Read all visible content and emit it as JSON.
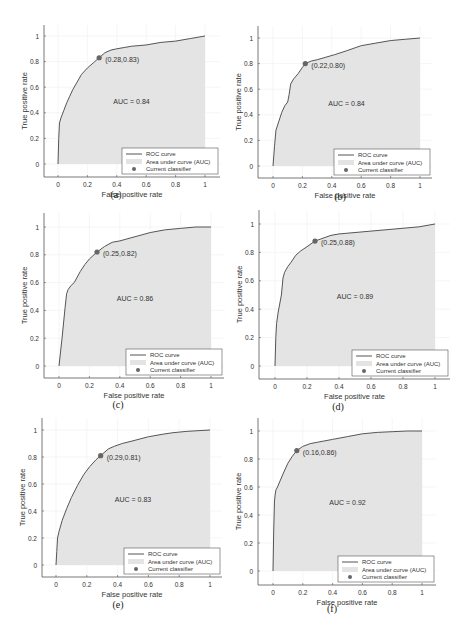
{
  "style": {
    "curve_color": "#555555",
    "fill_color": "#e4e4e4",
    "marker_color": "#666666",
    "axis_color": "#555555",
    "grid_color": "#eeeeee",
    "text_color": "#333333"
  },
  "chart_data": [
    {
      "id": "a",
      "caption": "(a)",
      "type": "area",
      "title": "",
      "xlabel": "False positive rate",
      "ylabel": "True positive rate",
      "xlim": [
        -0.1,
        1.1
      ],
      "ylim": [
        -0.1,
        1.1
      ],
      "xticks": [
        "0",
        "0.2",
        "0.4",
        "0.6",
        "0.8",
        "1"
      ],
      "yticks": [
        "0",
        "0.2",
        "0.4",
        "0.6",
        "0.8",
        "1"
      ],
      "grid": true,
      "legend": [
        "ROC curve",
        "Area under curve (AUC)",
        "Current classifier"
      ],
      "legend_position": "lower right",
      "auc_label": "AUC = 0.84",
      "classifier_point": {
        "x": 0.28,
        "y": 0.83,
        "label": "(0.28,0.83)"
      },
      "x": [
        0,
        0.005,
        0.01,
        0.02,
        0.04,
        0.06,
        0.08,
        0.1,
        0.13,
        0.16,
        0.2,
        0.24,
        0.28,
        0.32,
        0.36,
        0.4,
        0.45,
        0.5,
        0.6,
        0.7,
        0.8,
        0.9,
        1.0
      ],
      "y": [
        0,
        0.2,
        0.32,
        0.36,
        0.42,
        0.48,
        0.53,
        0.58,
        0.64,
        0.7,
        0.75,
        0.79,
        0.83,
        0.87,
        0.89,
        0.9,
        0.91,
        0.92,
        0.93,
        0.95,
        0.96,
        0.98,
        1.0
      ]
    },
    {
      "id": "b",
      "caption": "(b)",
      "type": "area",
      "title": "",
      "xlabel": "False positive rate",
      "ylabel": "True positive rate",
      "xlim": [
        -0.1,
        1.1
      ],
      "ylim": [
        -0.1,
        1.1
      ],
      "xticks": [
        "0",
        "0.2",
        "0.4",
        "0.6",
        "0.8",
        "1"
      ],
      "yticks": [
        "0",
        "0.2",
        "0.4",
        "0.6",
        "0.8",
        "1"
      ],
      "grid": true,
      "legend": [
        "ROC curve",
        "Area under curve (AUC)",
        "Current classifier"
      ],
      "legend_position": "lower right",
      "auc_label": "AUC = 0.84",
      "classifier_point": {
        "x": 0.22,
        "y": 0.8,
        "label": "(0.22,0.80)"
      },
      "x": [
        0,
        0.01,
        0.02,
        0.04,
        0.06,
        0.08,
        0.1,
        0.11,
        0.12,
        0.14,
        0.17,
        0.2,
        0.22,
        0.26,
        0.3,
        0.36,
        0.42,
        0.5,
        0.6,
        0.7,
        0.8,
        0.9,
        1.0
      ],
      "y": [
        0,
        0.15,
        0.28,
        0.35,
        0.42,
        0.47,
        0.5,
        0.56,
        0.64,
        0.68,
        0.72,
        0.77,
        0.8,
        0.82,
        0.83,
        0.85,
        0.87,
        0.9,
        0.94,
        0.96,
        0.98,
        0.99,
        1.0
      ]
    },
    {
      "id": "c",
      "caption": "(c)",
      "type": "area",
      "title": "",
      "xlabel": "False positive rate",
      "ylabel": "True positive rate",
      "xlim": [
        -0.1,
        1.1
      ],
      "ylim": [
        -0.1,
        1.1
      ],
      "xticks": [
        "0",
        "0.2",
        "0.4",
        "0.6",
        "0.8",
        "1"
      ],
      "yticks": [
        "0",
        "0.2",
        "0.4",
        "0.6",
        "0.8",
        "1"
      ],
      "grid": true,
      "legend": [
        "ROC curve",
        "Area under curve (AUC)",
        "Current classifier"
      ],
      "legend_position": "lower right",
      "auc_label": "AUC = 0.86",
      "classifier_point": {
        "x": 0.25,
        "y": 0.82,
        "label": "(0.25,0.82)"
      },
      "x": [
        0,
        0.02,
        0.04,
        0.05,
        0.06,
        0.08,
        0.1,
        0.12,
        0.14,
        0.17,
        0.2,
        0.25,
        0.3,
        0.35,
        0.4,
        0.5,
        0.6,
        0.7,
        0.8,
        0.9,
        1.0
      ],
      "y": [
        0,
        0.2,
        0.42,
        0.52,
        0.55,
        0.58,
        0.6,
        0.64,
        0.68,
        0.73,
        0.77,
        0.82,
        0.86,
        0.89,
        0.9,
        0.93,
        0.96,
        0.98,
        0.99,
        1.0,
        1.0
      ]
    },
    {
      "id": "d",
      "caption": "(d)",
      "type": "area",
      "title": "",
      "xlabel": "False positive rate",
      "ylabel": "True positive rate",
      "xlim": [
        -0.1,
        1.1
      ],
      "ylim": [
        -0.1,
        1.1
      ],
      "xticks": [
        "0",
        "0.2",
        "0.4",
        "0.6",
        "0.8",
        "1"
      ],
      "yticks": [
        "0",
        "0.2",
        "0.4",
        "0.6",
        "0.8",
        "1"
      ],
      "grid": true,
      "legend": [
        "ROC curve",
        "Area under curve (AUC)",
        "Current classifier"
      ],
      "legend_position": "lower right",
      "auc_label": "AUC = 0.89",
      "classifier_point": {
        "x": 0.25,
        "y": 0.88,
        "label": "(0.25,0.88)"
      },
      "x": [
        0,
        0.005,
        0.01,
        0.02,
        0.04,
        0.05,
        0.06,
        0.08,
        0.1,
        0.13,
        0.16,
        0.2,
        0.25,
        0.3,
        0.35,
        0.4,
        0.5,
        0.6,
        0.7,
        0.8,
        0.9,
        1.0
      ],
      "y": [
        0,
        0.2,
        0.3,
        0.38,
        0.5,
        0.62,
        0.66,
        0.7,
        0.73,
        0.78,
        0.81,
        0.84,
        0.88,
        0.9,
        0.92,
        0.93,
        0.94,
        0.95,
        0.96,
        0.97,
        0.98,
        1.0
      ]
    },
    {
      "id": "e",
      "caption": "(e)",
      "type": "area",
      "title": "",
      "xlabel": "False positive rate",
      "ylabel": "True positive rate",
      "xlim": [
        -0.1,
        1.1
      ],
      "ylim": [
        -0.1,
        1.1
      ],
      "xticks": [
        "0",
        "0.2",
        "0.4",
        "0.6",
        "0.8",
        "1"
      ],
      "yticks": [
        "0",
        "0.2",
        "0.4",
        "0.6",
        "0.8",
        "1"
      ],
      "grid": true,
      "legend": [
        "ROC curve",
        "Area under curve (AUC)",
        "Current classifier"
      ],
      "legend_position": "lower right",
      "auc_label": "AUC = 0.83",
      "classifier_point": {
        "x": 0.29,
        "y": 0.81,
        "label": "(0.29,0.81)"
      },
      "x": [
        0,
        0.005,
        0.01,
        0.02,
        0.04,
        0.07,
        0.1,
        0.14,
        0.18,
        0.22,
        0.26,
        0.29,
        0.34,
        0.38,
        0.43,
        0.5,
        0.6,
        0.7,
        0.76,
        0.85,
        1.0
      ],
      "y": [
        0,
        0.1,
        0.2,
        0.25,
        0.33,
        0.42,
        0.5,
        0.59,
        0.67,
        0.73,
        0.78,
        0.81,
        0.86,
        0.88,
        0.9,
        0.92,
        0.95,
        0.97,
        0.98,
        0.99,
        1.0
      ]
    },
    {
      "id": "f",
      "caption": "(f)",
      "type": "area",
      "title": "",
      "xlabel": "False positive rate",
      "ylabel": "True positive rate",
      "xlim": [
        -0.1,
        1.1
      ],
      "ylim": [
        -0.1,
        1.1
      ],
      "xticks": [
        "0",
        "0.2",
        "0.4",
        "0.6",
        "0.8",
        "1"
      ],
      "yticks": [
        "0",
        "0.2",
        "0.4",
        "0.6",
        "0.8",
        "1"
      ],
      "grid": true,
      "legend": [
        "ROC curve",
        "Area under curve (AUC)",
        "Current classifier"
      ],
      "legend_position": "lower right",
      "auc_label": "AUC = 0.92",
      "classifier_point": {
        "x": 0.16,
        "y": 0.86,
        "label": "(0.16,0.86)"
      },
      "x": [
        0,
        0.005,
        0.01,
        0.015,
        0.02,
        0.03,
        0.05,
        0.07,
        0.1,
        0.13,
        0.16,
        0.2,
        0.25,
        0.3,
        0.4,
        0.5,
        0.6,
        0.7,
        0.8,
        0.9,
        1.0
      ],
      "y": [
        0,
        0.3,
        0.5,
        0.55,
        0.58,
        0.6,
        0.65,
        0.7,
        0.77,
        0.82,
        0.86,
        0.89,
        0.91,
        0.92,
        0.94,
        0.96,
        0.98,
        0.99,
        0.995,
        1.0,
        1.0
      ]
    }
  ],
  "layout": [
    {
      "left": 44,
      "top": 25,
      "axR": 220,
      "axB": 177,
      "x0": 58,
      "x1": 205,
      "y0": 164,
      "y1": 36,
      "capX": 116,
      "capY": 196
    },
    {
      "left": 258,
      "top": 26,
      "axR": 432,
      "axB": 178,
      "x0": 273,
      "x1": 420,
      "y0": 166,
      "y1": 38,
      "capX": 340,
      "capY": 198
    },
    {
      "left": 44,
      "top": 213,
      "axR": 224,
      "axB": 378,
      "x0": 59,
      "x1": 211,
      "y0": 366,
      "y1": 227,
      "capX": 118,
      "capY": 406
    },
    {
      "left": 259,
      "top": 210,
      "axR": 450,
      "axB": 379,
      "x0": 275,
      "x1": 435,
      "y0": 366,
      "y1": 224,
      "capX": 338,
      "capY": 408
    },
    {
      "left": 42,
      "top": 418,
      "axR": 222,
      "axB": 577,
      "x0": 56,
      "x1": 210,
      "y0": 565,
      "y1": 430,
      "capX": 118,
      "capY": 606
    },
    {
      "left": 258,
      "top": 418,
      "axR": 436,
      "axB": 585,
      "x0": 273,
      "x1": 422,
      "y0": 571,
      "y1": 431,
      "capX": 332,
      "capY": 610
    }
  ]
}
